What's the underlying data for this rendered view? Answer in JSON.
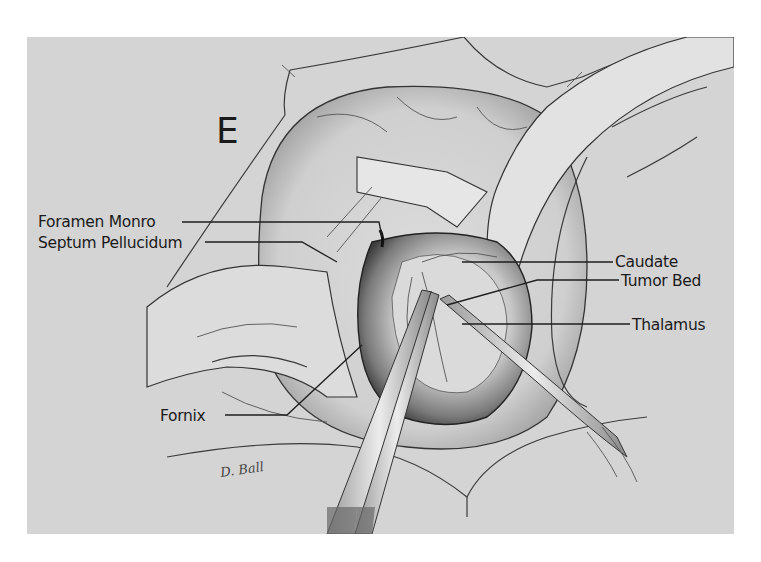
{
  "figure": {
    "panel_letter": "E",
    "signature": "D. Ball",
    "labels": {
      "foramen_monro": "Foramen Monro",
      "septum_pellucidum": "Septum Pellucidum",
      "fornix": "Fornix",
      "caudate": "Caudate",
      "tumor_bed": "Tumor Bed",
      "thalamus": "Thalamus"
    },
    "colors": {
      "page_background": "#ffffff",
      "panel_background": "#d4d4d4",
      "ink": "#1e1e1e"
    }
  }
}
